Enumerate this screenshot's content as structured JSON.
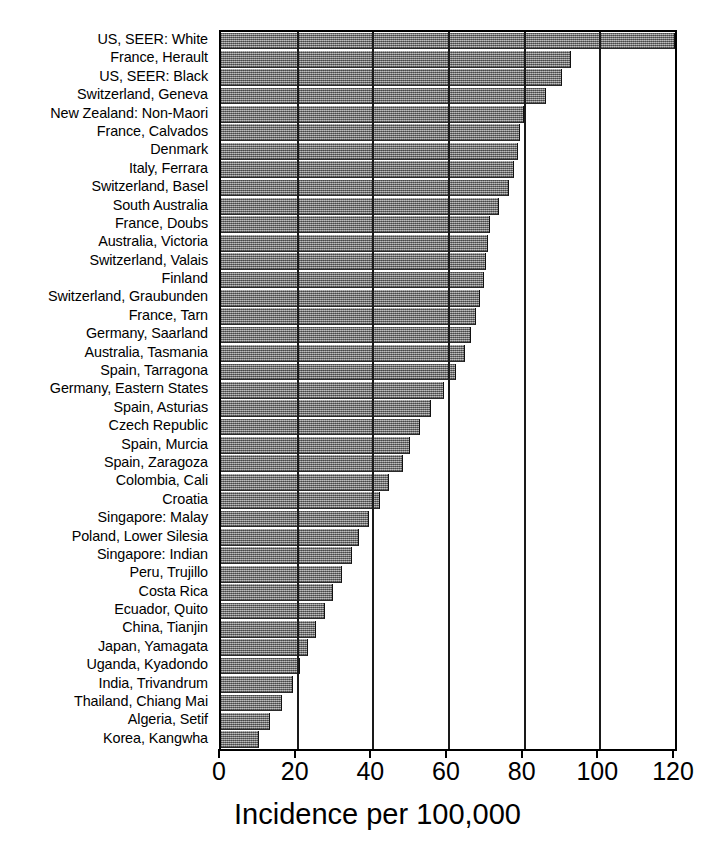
{
  "chart_data": {
    "type": "bar",
    "orientation": "horizontal",
    "title": "",
    "xlabel": "Incidence per 100,000",
    "ylabel": "",
    "xlim": [
      0,
      120
    ],
    "xticks": [
      0,
      20,
      40,
      60,
      80,
      100,
      120
    ],
    "grid": true,
    "legend": null,
    "bar_color": "#8c8c8c",
    "categories": [
      "US, SEER: White",
      "France, Herault",
      "US, SEER: Black",
      "Switzerland, Geneva",
      "New Zealand: Non-Maori",
      "France, Calvados",
      "Denmark",
      "Italy, Ferrara",
      "Switzerland, Basel",
      "South Australia",
      "France, Doubs",
      "Australia, Victoria",
      "Switzerland, Valais",
      "Finland",
      "Switzerland, Graubunden",
      "France, Tarn",
      "Germany, Saarland",
      "Australia, Tasmania",
      "Spain, Tarragona",
      "Germany, Eastern States",
      "Spain, Asturias",
      "Czech Republic",
      "Spain, Murcia",
      "Spain, Zaragoza",
      "Colombia, Cali",
      "Croatia",
      "Singapore: Malay",
      "Poland, Lower Silesia",
      "Singapore: Indian",
      "Peru, Trujillo",
      "Costa Rica",
      "Ecuador, Quito",
      "China, Tianjin",
      "Japan, Yamagata",
      "Uganda, Kyadondo",
      "India, Trivandrum",
      "Thailand, Chiang Mai",
      "Algeria, Setif",
      "Korea, Kangwha"
    ],
    "values": [
      120.0,
      92.5,
      90.0,
      86.0,
      80.0,
      79.0,
      78.5,
      77.5,
      76.0,
      73.5,
      71.0,
      70.5,
      70.0,
      69.5,
      68.5,
      67.5,
      66.0,
      64.5,
      62.0,
      59.0,
      55.5,
      52.5,
      50.0,
      48.0,
      44.5,
      42.0,
      39.0,
      36.5,
      34.5,
      32.0,
      29.5,
      27.5,
      25.0,
      23.0,
      21.0,
      19.0,
      16.0,
      13.0,
      10.0
    ]
  },
  "axis": {
    "title": "Incidence per 100,000",
    "tick_labels": [
      "0",
      "20",
      "40",
      "60",
      "80",
      "100",
      "120"
    ]
  }
}
